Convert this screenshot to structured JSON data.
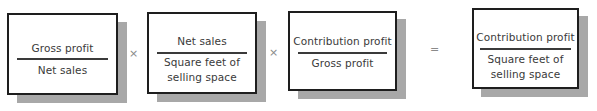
{
  "equation": {
    "terms": [
      {
        "numerator": "Gross profit",
        "denominator_line1": "Net sales",
        "denominator_line2": ""
      },
      {
        "numerator": "Net sales",
        "denominator_line1": "Square feet of",
        "denominator_line2": "selling space"
      },
      {
        "numerator": "Contribution profit",
        "denominator_line1": "Gross profit",
        "denominator_line2": ""
      }
    ],
    "operators": [
      "×",
      "×",
      "="
    ],
    "result": {
      "numerator": "Contribution profit",
      "denominator_line1": "Square feet of",
      "denominator_line2": "selling space"
    }
  },
  "colors": {
    "border": "#1e1e1e",
    "shadow": "#a8a8a8",
    "text": "#3a3a3a",
    "operator": "#8a8a8a"
  }
}
